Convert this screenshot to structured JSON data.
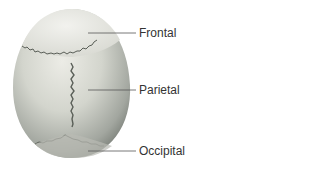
{
  "diagram": {
    "labels": [
      {
        "id": "frontal",
        "text": "Frontal"
      },
      {
        "id": "parietal",
        "text": "Parietal"
      },
      {
        "id": "occipital",
        "text": "Occipital"
      }
    ]
  },
  "colors": {
    "bone_light": "#e6e6df",
    "bone_mid": "#c9cbc2",
    "bone_dark": "#7e827b",
    "suture": "#5a5f58",
    "line": "#555555",
    "text": "#333333"
  }
}
